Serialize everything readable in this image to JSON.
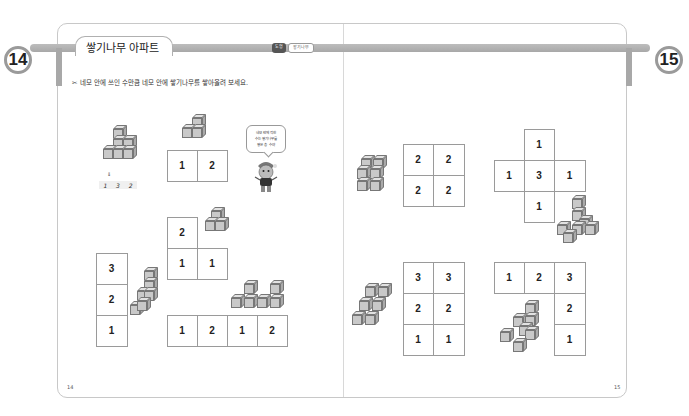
{
  "left_page": {
    "badge": "14",
    "title": "쌓기나무 아파트",
    "tags": [
      "도형",
      "쌓기나무"
    ],
    "instruction": "✂ 네모 안에 쓰인 수만큼 네모 안에 쌓기나무를 쌓아올려 보세요.",
    "page_number": "14",
    "example": {
      "arrow": "⇓",
      "answer": [
        "1",
        "3",
        "2"
      ]
    },
    "speech_bubble": {
      "lines": [
        "네모 안에 적힌",
        "수는 쌓기나무를",
        "쌓은 층 수야"
      ]
    },
    "puzzles": [
      {
        "id": "p1",
        "rows": [
          [
            "1",
            "2"
          ]
        ]
      },
      {
        "id": "p2",
        "rows": [
          [
            "2",
            ""
          ],
          [
            "1",
            "1"
          ]
        ]
      },
      {
        "id": "p3",
        "rows": [
          [
            "3"
          ],
          [
            "2"
          ],
          [
            "1"
          ]
        ]
      },
      {
        "id": "p4",
        "rows": [
          [
            "1",
            "2",
            "1",
            "2"
          ]
        ]
      }
    ]
  },
  "right_page": {
    "badge": "15",
    "page_number": "15",
    "puzzles": [
      {
        "id": "p5",
        "rows": [
          [
            "2",
            "2"
          ],
          [
            "2",
            "2"
          ]
        ]
      },
      {
        "id": "p6",
        "rows": [
          [
            "",
            "1",
            ""
          ],
          [
            "1",
            "3",
            "1"
          ],
          [
            "",
            "1",
            ""
          ]
        ]
      },
      {
        "id": "p7",
        "rows": [
          [
            "3",
            "3"
          ],
          [
            "2",
            "2"
          ],
          [
            "1",
            "1"
          ]
        ]
      },
      {
        "id": "p8",
        "rows": [
          [
            "1",
            "2",
            "3"
          ],
          [
            "",
            "",
            "2"
          ],
          [
            "",
            "",
            "1"
          ]
        ]
      }
    ]
  },
  "colors": {
    "ribbon": "#a8a8a8",
    "border": "#c8c8c8",
    "cube_front": "#c9c9c9",
    "cube_top": "#e2e2e2",
    "cube_side": "#aaaaaa"
  }
}
